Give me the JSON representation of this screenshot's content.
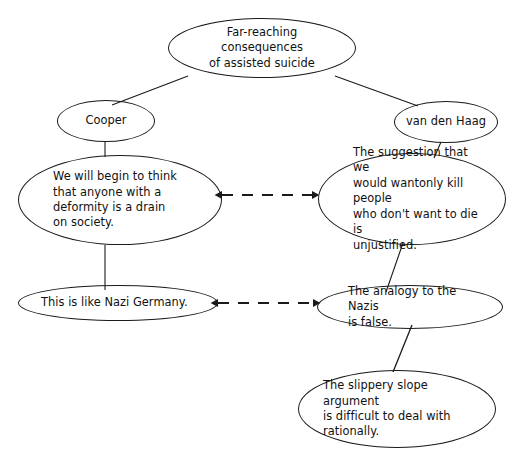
{
  "diagram": {
    "background_color": "#ffffff",
    "stroke_color": "#1a1a1a",
    "text_color": "#111111",
    "nodes": [
      {
        "id": "topic",
        "label": "Far-reaching consequences\nof assisted suicide",
        "role": "topic",
        "align": "center"
      },
      {
        "id": "cooper",
        "label": "Cooper",
        "role": "proponent",
        "align": "center"
      },
      {
        "id": "van_den_haag",
        "label": "van den Haag",
        "role": "proponent",
        "align": "center"
      },
      {
        "id": "cooper_claim_1",
        "label": "We will begin to think\nthat anyone with a\ndeformity is a drain\non society.",
        "role": "claim",
        "align": "left"
      },
      {
        "id": "haag_claim_1",
        "label": "The suggestion that we\nwould wantonly kill people\nwho don't want to die is\nunjustified.",
        "role": "claim",
        "align": "left"
      },
      {
        "id": "cooper_claim_2",
        "label": "This is like Nazi Germany.",
        "role": "claim",
        "align": "left"
      },
      {
        "id": "haag_claim_2",
        "label": "The analogy to the Nazis\nis false.",
        "role": "claim",
        "align": "left"
      },
      {
        "id": "haag_claim_3",
        "label": "The slippery slope argument\nis difficult to deal with\nrationally.",
        "role": "claim",
        "align": "left"
      }
    ],
    "edges": [
      {
        "id": "topic-cooper",
        "from": "topic",
        "to": "cooper",
        "style": "solid"
      },
      {
        "id": "topic-haag",
        "from": "topic",
        "to": "van_den_haag",
        "style": "solid"
      },
      {
        "id": "cooper-claim1",
        "from": "cooper",
        "to": "cooper_claim_1",
        "style": "solid"
      },
      {
        "id": "haag-claim1",
        "from": "van_den_haag",
        "to": "haag_claim_1",
        "style": "solid"
      },
      {
        "id": "cooperclaim1-claim2",
        "from": "cooper_claim_1",
        "to": "cooper_claim_2",
        "style": "solid"
      },
      {
        "id": "haagclaim1-claim2",
        "from": "haag_claim_1",
        "to": "haag_claim_2",
        "style": "solid"
      },
      {
        "id": "haagclaim2-claim3",
        "from": "haag_claim_2",
        "to": "haag_claim_3",
        "style": "solid"
      },
      {
        "id": "rebuttal-upper",
        "from": "cooper_claim_1",
        "to": "haag_claim_1",
        "style": "dashed-double-arrow"
      },
      {
        "id": "rebuttal-lower",
        "from": "cooper_claim_2",
        "to": "haag_claim_2",
        "style": "dashed-double-arrow"
      }
    ]
  }
}
